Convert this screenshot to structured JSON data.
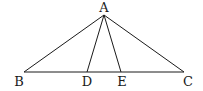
{
  "diagram": {
    "title": "",
    "points": [
      {
        "id": "A",
        "label": "A"
      },
      {
        "id": "B",
        "label": "B"
      },
      {
        "id": "C",
        "label": "C"
      },
      {
        "id": "D",
        "label": "D"
      },
      {
        "id": "E",
        "label": "E"
      }
    ],
    "segments": [
      {
        "from": "A",
        "to": "B"
      },
      {
        "from": "A",
        "to": "C"
      },
      {
        "from": "A",
        "to": "D"
      },
      {
        "from": "A",
        "to": "E"
      },
      {
        "from": "B",
        "to": "C"
      }
    ],
    "line_color": "#1a1a1a"
  }
}
